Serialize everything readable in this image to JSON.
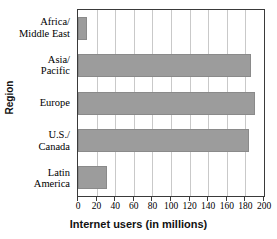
{
  "chart_data": {
    "type": "bar",
    "orientation": "horizontal",
    "title": "",
    "xlabel": "Internet users (in millions)",
    "ylabel": "Region",
    "categories": [
      "Africa/ Middle East",
      "Asia/ Pacific",
      "Europe",
      "U.S./ Canada",
      "Latin America"
    ],
    "category_lines": [
      [
        "Africa/",
        "Middle East"
      ],
      [
        "Asia/",
        "Pacific"
      ],
      [
        "Europe"
      ],
      [
        "U.S./",
        "Canada"
      ],
      [
        "Latin",
        "America"
      ]
    ],
    "values": [
      10,
      186,
      190,
      184,
      31
    ],
    "xlim": [
      0,
      200
    ],
    "xticks": [
      0,
      20,
      40,
      60,
      80,
      100,
      120,
      140,
      160,
      180,
      200
    ],
    "xtick_labels": [
      "0",
      "20",
      "40",
      "60",
      "80",
      "100",
      "120",
      "140",
      "160",
      "180",
      "200"
    ],
    "grid": "vertical",
    "legend": "none",
    "bar_color": "#9c9c9c",
    "bar_edge_color": "#8a8a8a",
    "gridline_color": "#c9c9c9",
    "axis_color": "#3a3a3a"
  }
}
